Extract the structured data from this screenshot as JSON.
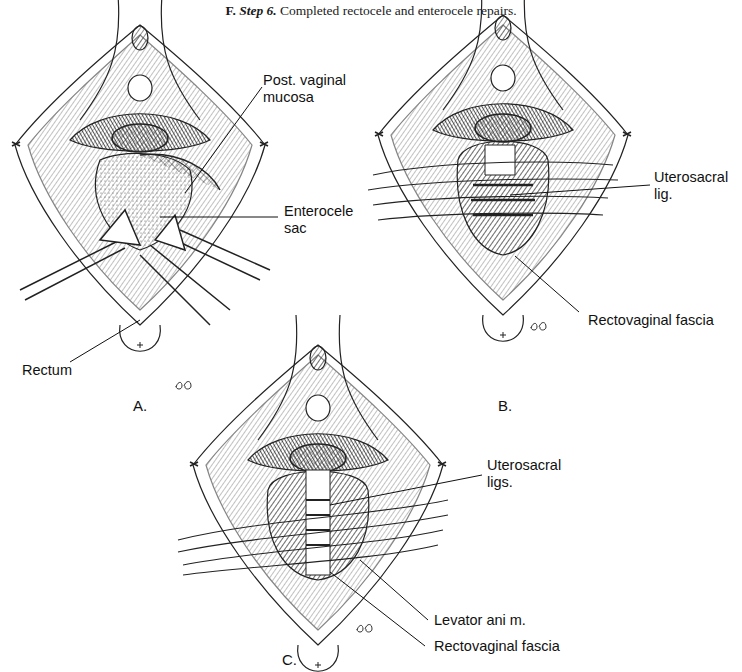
{
  "figure": {
    "caption_letter": "F.",
    "caption_step": "Step 6.",
    "caption_text": "Completed rectocele and enterocele repairs.",
    "panels": [
      {
        "letter": "A.",
        "labels": [
          "Post. vaginal\nmucosa",
          "Enterocele\nsac",
          "Rectum"
        ]
      },
      {
        "letter": "B.",
        "labels": [
          "Uterosacral\nlig.",
          "Rectovaginal fascia"
        ]
      },
      {
        "letter": "C.",
        "labels": [
          "Uterosacral\nligs.",
          "Levator ani m.",
          "Rectovaginal fascia"
        ]
      }
    ],
    "signature": "PB"
  }
}
